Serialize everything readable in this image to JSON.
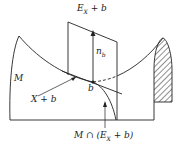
{
  "diagram": {
    "labels": {
      "plane": "E",
      "plane_sub": "X",
      "plane_suffix": " + b",
      "normal": "n",
      "normal_sub": "b",
      "surface": "M",
      "tangent": "X + b",
      "point": "b",
      "intersection_prefix": "M ∩ (E",
      "intersection_sub": "X",
      "intersection_suffix": " + b)"
    },
    "colors": {
      "stroke": "#222222",
      "background": "#ffffff"
    }
  }
}
